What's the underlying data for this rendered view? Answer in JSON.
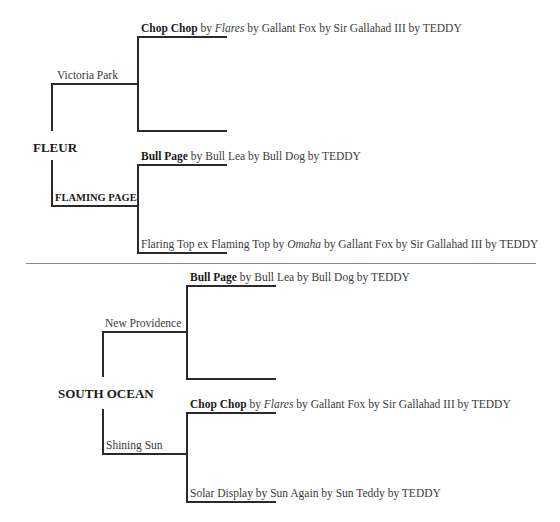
{
  "pedigrees": [
    {
      "subject": "FLEUR",
      "sire": {
        "name": "Victoria Park",
        "bold": false
      },
      "dam": {
        "name": "FLAMING PAGE",
        "bold": true
      },
      "sire_sire": {
        "bold": "Chop Chop",
        "by1": " by ",
        "italic": "Flares",
        "rest": " by Gallant Fox by Sir Gallahad III by TEDDY"
      },
      "sire_dam": {
        "text": ""
      },
      "dam_sire": {
        "bold": "Bull Page",
        "rest": " by Bull Lea by Bull Dog by TEDDY"
      },
      "dam_dam": {
        "pre": "Flaring Top ex Flaming Top by ",
        "italic": "Omaha",
        "rest": " by Gallant Fox by Sir Gallahad III by TEDDY"
      }
    },
    {
      "subject": "SOUTH OCEAN",
      "sire": {
        "name": "New Providence",
        "bold": false
      },
      "dam": {
        "name": "Shining Sun",
        "bold": false
      },
      "sire_sire": {
        "bold": "Bull Page",
        "rest": " by Bull Lea by Bull Dog by TEDDY"
      },
      "sire_dam": {
        "text": ""
      },
      "dam_sire": {
        "bold": "Chop Chop",
        "by1": " by ",
        "italic": "Flares",
        "rest": " by Gallant Fox by Sir Gallahad III by TEDDY"
      },
      "dam_dam": {
        "text": "Solar Display by Sun Again by Sun Teddy by TEDDY"
      }
    }
  ],
  "colors": {
    "line": "#2a2a2a",
    "separator": "#8a8a8a",
    "text": "#3a3a3a",
    "bold_text": "#1a1a1a"
  }
}
